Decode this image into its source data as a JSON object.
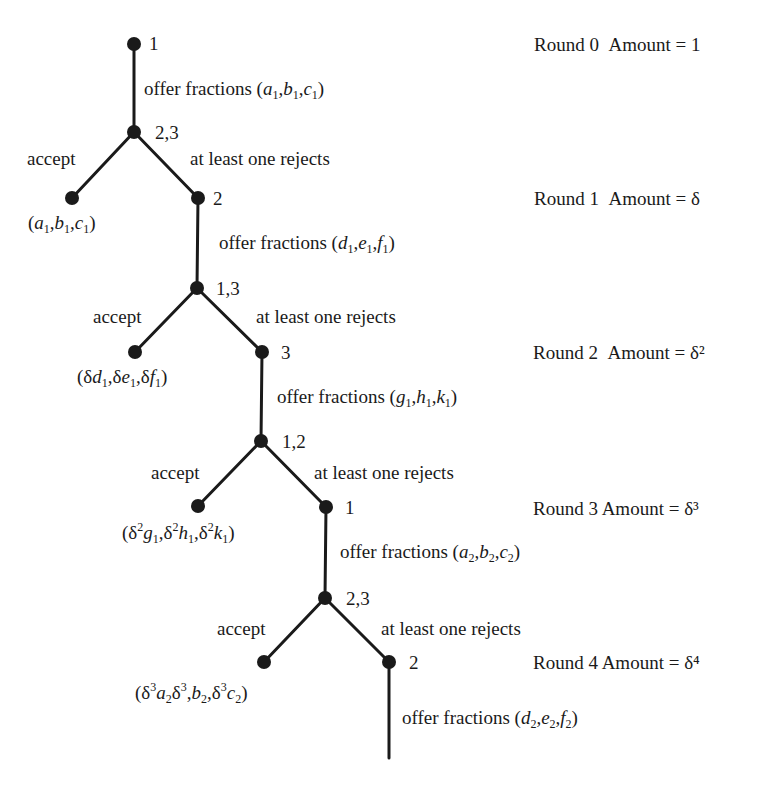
{
  "colors": {
    "ink": "#1a1a1a",
    "background": "#ffffff"
  },
  "nodes": [
    {
      "id": "n0",
      "x": 134,
      "y": 44,
      "label": "1"
    },
    {
      "id": "n1",
      "x": 134,
      "y": 132,
      "label": "2,3"
    },
    {
      "id": "leaf1",
      "x": 72,
      "y": 198,
      "label": ""
    },
    {
      "id": "n2",
      "x": 198,
      "y": 198,
      "label": "2"
    },
    {
      "id": "n3",
      "x": 197,
      "y": 288,
      "label": "1,3"
    },
    {
      "id": "leaf2",
      "x": 135,
      "y": 352,
      "label": ""
    },
    {
      "id": "n4",
      "x": 262,
      "y": 352,
      "label": "3"
    },
    {
      "id": "n5",
      "x": 261,
      "y": 441,
      "label": "1,2"
    },
    {
      "id": "leaf3",
      "x": 198,
      "y": 506,
      "label": ""
    },
    {
      "id": "n6",
      "x": 326,
      "y": 507,
      "label": "1"
    },
    {
      "id": "n7",
      "x": 325,
      "y": 598,
      "label": "2,3"
    },
    {
      "id": "leaf4",
      "x": 264,
      "y": 662,
      "label": ""
    },
    {
      "id": "n8",
      "x": 389,
      "y": 662,
      "label": "2"
    }
  ],
  "edges": [
    [
      "n0",
      "n1"
    ],
    [
      "n1",
      "leaf1"
    ],
    [
      "n1",
      "n2"
    ],
    [
      "n2",
      "n3"
    ],
    [
      "n3",
      "leaf2"
    ],
    [
      "n3",
      "n4"
    ],
    [
      "n4",
      "n5"
    ],
    [
      "n5",
      "leaf3"
    ],
    [
      "n5",
      "n6"
    ],
    [
      "n6",
      "n7"
    ],
    [
      "n7",
      "leaf4"
    ],
    [
      "n7",
      "n8"
    ],
    [
      "n8",
      "end"
    ]
  ],
  "end_point": {
    "x": 389,
    "y": 758
  },
  "edge_labels": {
    "offer_text": "offer fractions",
    "accept": "accept",
    "reject": "at least one rejects"
  },
  "offers": [
    "(a1,b1,c1)",
    "(d1,e1,f1)",
    "(g1,h1,k1)",
    "(a2,b2,c2)",
    "(d2,e2,f2)"
  ],
  "payoffs": [
    "(a1,b1,c1)",
    "(δd1,δe1,δf1)",
    "(δ²g1,δ²h1,δ²k1)",
    "(δ³a2δ³,b2,δ³c2)"
  ],
  "rounds": [
    {
      "round": "Round 0",
      "amount": "Amount = 1"
    },
    {
      "round": "Round 1",
      "amount": "Amount = δ"
    },
    {
      "round": "Round 2",
      "amount": "Amount = δ²"
    },
    {
      "round": "Round 3",
      "amount": "Amount = δ³"
    },
    {
      "round": "Round 4",
      "amount": "Amount = δ⁴"
    }
  ]
}
